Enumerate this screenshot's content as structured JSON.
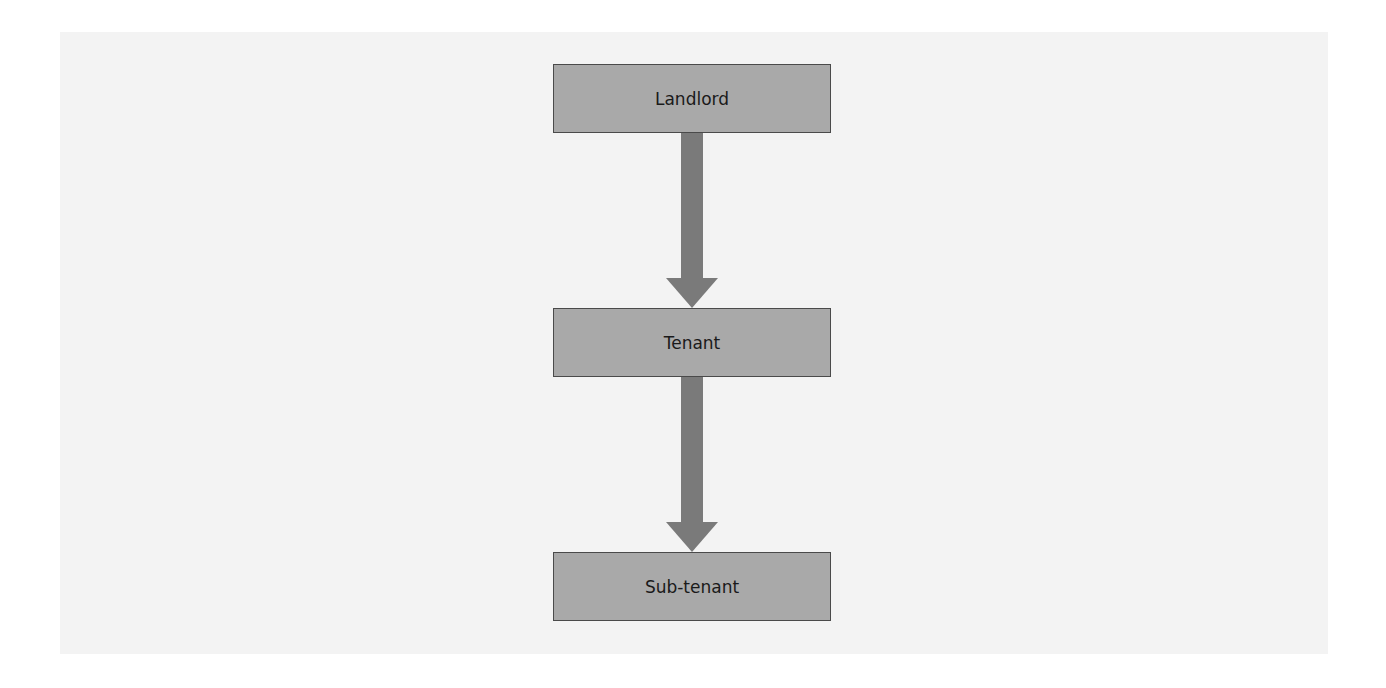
{
  "diagram": {
    "type": "flow",
    "direction": "top-to-bottom",
    "nodes": [
      {
        "id": "landlord",
        "label": "Landlord"
      },
      {
        "id": "tenant",
        "label": "Tenant"
      },
      {
        "id": "subtenant",
        "label": "Sub-tenant"
      }
    ],
    "edges": [
      {
        "from": "landlord",
        "to": "tenant"
      },
      {
        "from": "tenant",
        "to": "subtenant"
      }
    ],
    "colors": {
      "node_fill": "#a9a9a9",
      "node_border": "#4a4a4a",
      "arrow": "#7a7a7a",
      "panel": "#f3f3f3"
    }
  }
}
